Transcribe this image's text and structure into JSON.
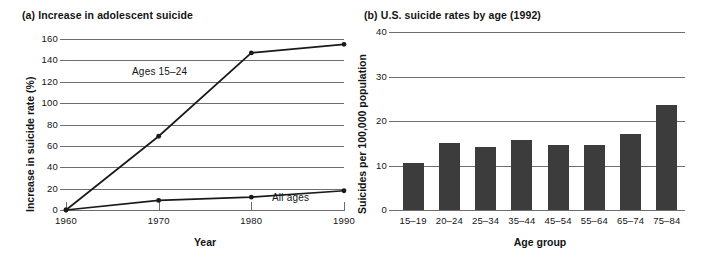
{
  "figure": {
    "panel_a": {
      "title": "(a) Increase in adolescent suicide",
      "axis_x_title": "Year",
      "axis_y_title": "Increase in suicide rate (%)"
    },
    "panel_b": {
      "title": "(b) U.S. suicide rates by age (1992)",
      "axis_x_title": "Age group",
      "axis_y_title": "Suicides per 100,000 population"
    },
    "colors": {
      "line": "#1a1a1a",
      "bar": "#3c3c3c",
      "grid": "#6e6e6e",
      "text": "#141414",
      "background": "#ffffff"
    }
  },
  "chart_data": [
    {
      "type": "line",
      "title": "(a) Increase in adolescent suicide",
      "xlabel": "Year",
      "ylabel": "Increase in suicide rate (%)",
      "x": [
        1960,
        1970,
        1980,
        1990
      ],
      "xticks": [
        "1960",
        "1970",
        "1980",
        "1990"
      ],
      "yticks": [
        0,
        20,
        40,
        60,
        80,
        100,
        120,
        140,
        160
      ],
      "ytick_labels": [
        "0",
        "20",
        "40",
        "60",
        "80",
        "100",
        "120",
        "140",
        "160"
      ],
      "ylim": [
        0,
        160
      ],
      "xlim": [
        1960,
        1990
      ],
      "grid": "horizontal",
      "legend": "inline-annotations",
      "series": [
        {
          "name": "Ages 15–24",
          "label": "Ages 15–24",
          "values": [
            0,
            69,
            147,
            155
          ],
          "marker": "filled-circle"
        },
        {
          "name": "All ages",
          "label": "All ages",
          "values": [
            0,
            9,
            12,
            18
          ],
          "marker": "filled-circle"
        }
      ]
    },
    {
      "type": "bar",
      "title": "(b) U.S. suicide rates by age (1992)",
      "xlabel": "Age group",
      "ylabel": "Suicides per 100,000 population",
      "categories": [
        "15–19",
        "20–24",
        "25–34",
        "35–44",
        "45–54",
        "55–64",
        "65–74",
        "75–84"
      ],
      "values": [
        10.6,
        15.0,
        14.2,
        15.7,
        14.5,
        14.7,
        17.1,
        23.5
      ],
      "yticks": [
        0,
        10,
        20,
        30,
        40
      ],
      "ytick_labels": [
        "0",
        "10",
        "20",
        "30",
        "40"
      ],
      "ylim": [
        0,
        40
      ],
      "grid": "horizontal",
      "legend": "none",
      "bar_color": "#3c3c3c"
    }
  ]
}
